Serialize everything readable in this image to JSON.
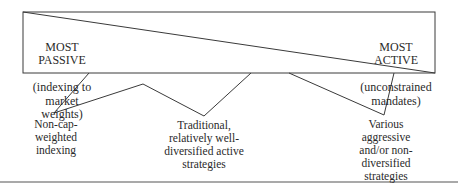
{
  "diagram": {
    "left_end": {
      "title": "MOST PASSIVE",
      "subtitle": "(indexing to\nmarket weights)"
    },
    "right_end": {
      "title": "MOST ACTIVE",
      "subtitle": "(unconstrained\nmandates)"
    },
    "categories": [
      {
        "label": "Non-cap-weighted\nindexing"
      },
      {
        "label": "Traditional,\nrelatively well-\ndiversified active\nstrategies"
      },
      {
        "label": "Various\naggressive\nand/or non-\ndiversified\nstrategies"
      }
    ],
    "colors": {
      "line": "#3a3a3a",
      "text": "#2a2a2a"
    }
  }
}
